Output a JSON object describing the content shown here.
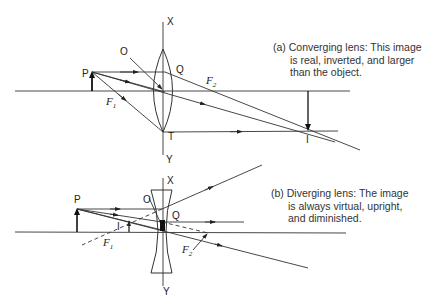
{
  "diagram": {
    "type": "ray-diagram",
    "panels": [
      {
        "id": "a",
        "lens": "converging",
        "caption": {
          "line1": "(a) Converging lens: This image",
          "line2": "is real, inverted, and larger",
          "line3": "than the object."
        },
        "labels": {
          "x_axis_top": "X",
          "y_axis_bottom": "Y",
          "object": "P",
          "center": "O",
          "point_q": "Q",
          "point_t": "T",
          "focus1": "F",
          "focus1_sub": "1",
          "focus2": "F",
          "focus2_sub": "2",
          "image": "I"
        }
      },
      {
        "id": "b",
        "lens": "diverging",
        "caption": {
          "line1": "(b) Diverging lens: The image",
          "line2": "is always virtual, upright,",
          "line3": "and diminished."
        },
        "labels": {
          "x_axis_top": "X",
          "y_axis_bottom": "Y",
          "object": "P",
          "center": "O",
          "point_q": "Q",
          "focus1": "F",
          "focus1_sub": "1",
          "focus2": "F",
          "focus2_sub": "2",
          "image": "I"
        }
      }
    ]
  }
}
